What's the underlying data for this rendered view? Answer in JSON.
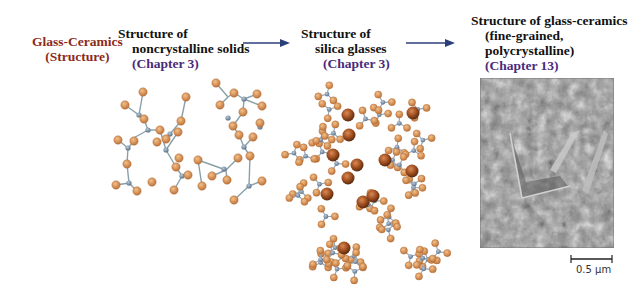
{
  "title": {
    "line1": "Glass-Ceramics",
    "line2": "(Structure)"
  },
  "panels": [
    {
      "line1": "Structure of",
      "line2": "noncrystalline solids",
      "chapter": "(Chapter 3)"
    },
    {
      "line1": "Structure of",
      "line2": "silica glasses",
      "chapter": "(Chapter 3)"
    },
    {
      "line1": "Structure of glass-ceramics",
      "line2": "(fine-grained,",
      "line3": "polycrystalline)",
      "chapter": "(Chapter 13)"
    }
  ],
  "scale_bar": {
    "label": "0.5 μm"
  },
  "colors": {
    "title": "#8b2a1a",
    "chapter": "#4a2a7a",
    "arrow": "#2b3f7a",
    "oxygen": "#d08850",
    "silicon": "#7a96a6",
    "cation": "#8b4513"
  }
}
